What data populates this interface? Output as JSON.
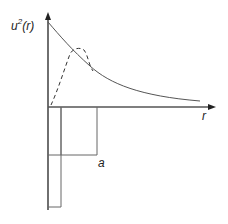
{
  "diagram": {
    "y_axis_label": {
      "base": "u",
      "superscript": "2",
      "argument": "(r)"
    },
    "x_axis_label": "r",
    "well_width_label": "a",
    "colors": {
      "axis": "#222222",
      "curve": "#555555",
      "dashed_curve": "#333333",
      "well": "#666666"
    },
    "curves": [
      {
        "name": "solid-decaying-curve",
        "style": "solid",
        "description": "monotonically decreasing u^2(r) from the axis"
      },
      {
        "name": "dashed-curve",
        "style": "dashed",
        "description": "rises from origin, peaks, then merges with solid curve"
      }
    ],
    "potential_well": {
      "description": "square-well potential below the r-axis with width a"
    }
  }
}
